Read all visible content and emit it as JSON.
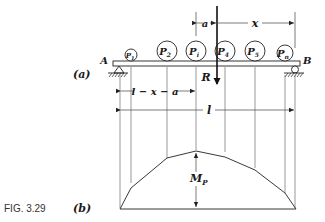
{
  "figure": {
    "caption": "FIG. 3.29",
    "part_a_label": "(a)",
    "part_b_label": "(b)"
  },
  "beam": {
    "left_support": "A",
    "right_support": "B",
    "loads": [
      {
        "label": "P1",
        "main": "P",
        "sub": "1",
        "x": 131,
        "r": 6
      },
      {
        "label": "P2",
        "main": "P",
        "sub": "2",
        "x": 167,
        "r": 10
      },
      {
        "label": "Pi",
        "main": "P",
        "sub": "i",
        "x": 196,
        "r": 10
      },
      {
        "label": "P4",
        "main": "P",
        "sub": "4",
        "x": 225,
        "r": 10
      },
      {
        "label": "P5",
        "main": "P",
        "sub": "5",
        "x": 255,
        "r": 10
      },
      {
        "label": "Pn",
        "main": "P",
        "sub": "n",
        "x": 285,
        "r": 8
      }
    ],
    "resultant": "R"
  },
  "dimensions": {
    "a": "a",
    "x": "x",
    "l_minus_x_minus_a": "l − x − a",
    "l": "l"
  },
  "moment_diagram": {
    "label_main": "M",
    "label_sub": "P"
  }
}
